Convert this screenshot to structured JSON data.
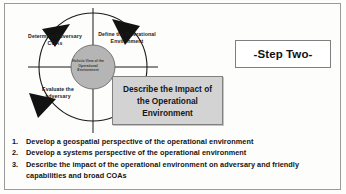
{
  "figure": {
    "title_box": {
      "label": "-Step Two-"
    },
    "cycle": {
      "center_label": "Holistic View of the Operational Environment",
      "nodes": [
        {
          "id": "determine-adversary-coas",
          "label": "Determine Adversary COAs"
        },
        {
          "id": "define-operational-environment",
          "label": "Define the Operational Environment"
        },
        {
          "id": "evaluate-the-adversary",
          "label": "Evaluate the adversary"
        },
        {
          "id": "describe-impact-operational-environment",
          "label": "Describe the Impact of the Operational Environment"
        }
      ]
    },
    "callout": {
      "label": "Describe the Impact of the Operational Environment"
    },
    "bullets": [
      {
        "number": "1.",
        "text": "Develop a geospatial perspective of the operational environment"
      },
      {
        "number": "2.",
        "text": "Develop a systems perspective of the operational environment"
      },
      {
        "number": "3.",
        "text": "Describe the impact of the operational environment on adversary and friendly capabilities and broad COAs"
      }
    ],
    "colors": {
      "callout_fill": "#d3d3d3",
      "callout_border": "#808080",
      "center_fill": "#b5b5b5",
      "line": "#1a1a1a",
      "frame": "#9a9a9a"
    }
  }
}
